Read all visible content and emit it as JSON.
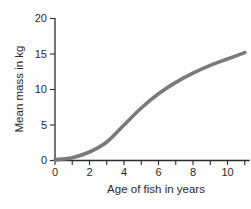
{
  "chart_data": {
    "type": "line",
    "title": "",
    "xlabel": "Age of fish in years",
    "ylabel": "Mean mass in kg",
    "x": [
      0,
      1,
      2,
      3,
      4,
      5,
      6,
      7,
      8,
      9,
      10,
      11
    ],
    "y": [
      0.1,
      0.4,
      1.2,
      2.6,
      5.0,
      7.4,
      9.4,
      11.0,
      12.3,
      13.4,
      14.3,
      15.2
    ],
    "xlim": [
      0,
      11.2
    ],
    "ylim": [
      0,
      20
    ],
    "x_major_ticks": [
      0,
      2,
      4,
      6,
      8,
      10
    ],
    "x_minor_ticks": [
      1,
      3,
      5,
      7,
      9,
      11
    ],
    "y_ticks": [
      0,
      5,
      10,
      15,
      20
    ],
    "grid": false,
    "legend": null,
    "line_color": "#7a7a7a",
    "line_width": 3.6,
    "axis_color": "#2b2b2b",
    "background": "#fdfdfd"
  }
}
